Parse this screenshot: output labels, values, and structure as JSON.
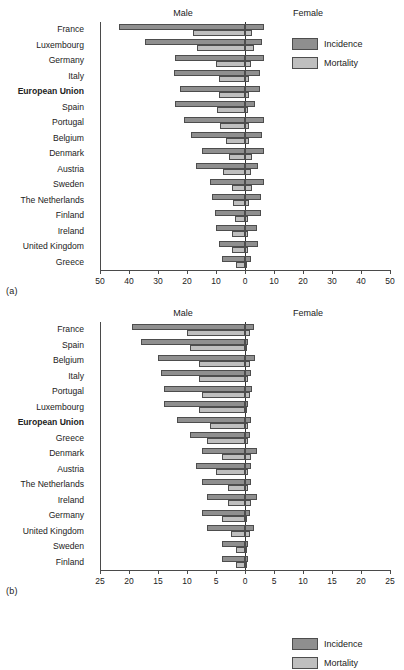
{
  "figure": {
    "panels": [
      {
        "tag": "(a)",
        "male_label": "Male",
        "female_label": "Female",
        "legend": [
          {
            "key": "incidence",
            "label": "Incidence",
            "color": "#8f8f8f"
          },
          {
            "key": "mortality",
            "label": "Mortality",
            "color": "#bfbfbf"
          }
        ]
      },
      {
        "tag": "(b)",
        "male_label": "Male",
        "female_label": "Female",
        "legend": [
          {
            "key": "incidence",
            "label": "Incidence",
            "color": "#8f8f8f"
          },
          {
            "key": "mortality",
            "label": "Mortality",
            "color": "#bfbfbf"
          }
        ]
      }
    ]
  },
  "chart_data": [
    {
      "type": "bar",
      "orientation": "horizontal",
      "style": "back-to-back population pyramid",
      "panel": "(a)",
      "title": "",
      "xlabel": "",
      "ylabel": "",
      "xlim": [
        -50,
        50
      ],
      "xticks": [
        -50,
        -40,
        -30,
        -20,
        -10,
        0,
        10,
        20,
        30,
        40,
        50
      ],
      "xticklabels": [
        "50",
        "40",
        "30",
        "20",
        "10",
        "0",
        "10",
        "20",
        "30",
        "40",
        "50"
      ],
      "grid": false,
      "legend_position": "upper right",
      "side_labels": {
        "left": "Male",
        "right": "Female"
      },
      "categories": [
        "France",
        "Luxembourg",
        "Germany",
        "Italy",
        "European Union",
        "Spain",
        "Portugal",
        "Belgium",
        "Denmark",
        "Austria",
        "Sweden",
        "The Netherlands",
        "Finland",
        "Ireland",
        "United Kingdom",
        "Greece"
      ],
      "highlighted_category": "European Union",
      "series": [
        {
          "name": "Incidence",
          "side": "male",
          "values": [
            43.5,
            34.5,
            24.0,
            24.5,
            22.5,
            24.0,
            21.0,
            18.5,
            15.0,
            17.0,
            12.0,
            11.5,
            10.5,
            10.0,
            9.0,
            8.0
          ]
        },
        {
          "name": "Mortality",
          "side": "male",
          "values": [
            18.0,
            16.5,
            10.0,
            9.0,
            9.0,
            9.5,
            8.5,
            6.5,
            5.5,
            7.5,
            4.5,
            4.0,
            3.5,
            4.5,
            4.5,
            3.0
          ]
        },
        {
          "name": "Incidence",
          "side": "female",
          "values": [
            6.5,
            6.0,
            6.5,
            5.0,
            5.0,
            3.5,
            6.5,
            6.0,
            6.5,
            4.5,
            6.5,
            5.5,
            5.5,
            4.0,
            4.5,
            2.0
          ]
        },
        {
          "name": "Mortality",
          "side": "female",
          "values": [
            2.5,
            3.0,
            2.0,
            1.5,
            1.5,
            1.0,
            1.5,
            1.5,
            2.5,
            2.0,
            2.5,
            1.5,
            1.0,
            1.0,
            1.0,
            0.5
          ]
        }
      ]
    },
    {
      "type": "bar",
      "orientation": "horizontal",
      "style": "back-to-back population pyramid",
      "panel": "(b)",
      "title": "",
      "xlabel": "",
      "ylabel": "",
      "xlim": [
        -25,
        25
      ],
      "xticks": [
        -25,
        -20,
        -15,
        -10,
        -5,
        0,
        5,
        10,
        15,
        20,
        25
      ],
      "xticklabels": [
        "25",
        "20",
        "15",
        "10",
        "5",
        "0",
        "5",
        "10",
        "15",
        "20",
        "25"
      ],
      "grid": false,
      "legend_position": "upper right",
      "side_labels": {
        "left": "Male",
        "right": "Female"
      },
      "categories": [
        "France",
        "Spain",
        "Belgium",
        "Italy",
        "Portugal",
        "Luxembourg",
        "European Union",
        "Greece",
        "Denmark",
        "Austria",
        "The Netherlands",
        "Ireland",
        "Germany",
        "United Kingdom",
        "Sweden",
        "Finland"
      ],
      "highlighted_category": "European Union",
      "series": [
        {
          "name": "Incidence",
          "side": "male",
          "values": [
            19.5,
            18.0,
            15.0,
            14.5,
            14.0,
            14.0,
            11.8,
            9.5,
            7.5,
            8.5,
            7.5,
            6.5,
            7.5,
            6.5,
            4.0,
            4.0
          ]
        },
        {
          "name": "Mortality",
          "side": "male",
          "values": [
            10.0,
            9.5,
            8.0,
            8.0,
            7.5,
            8.0,
            6.0,
            6.5,
            4.0,
            5.0,
            3.0,
            3.0,
            4.0,
            2.5,
            1.5,
            1.5
          ]
        },
        {
          "name": "Incidence",
          "side": "female",
          "values": [
            1.5,
            0.5,
            1.7,
            1.0,
            1.2,
            0.5,
            1.0,
            0.8,
            2.0,
            1.0,
            1.0,
            2.0,
            0.8,
            1.5,
            0.5,
            0.5
          ]
        },
        {
          "name": "Mortality",
          "side": "female",
          "values": [
            0.8,
            0.4,
            0.8,
            0.5,
            0.8,
            0.4,
            0.5,
            0.5,
            1.0,
            0.5,
            0.5,
            1.0,
            0.4,
            0.8,
            0.3,
            0.3
          ]
        }
      ]
    }
  ]
}
